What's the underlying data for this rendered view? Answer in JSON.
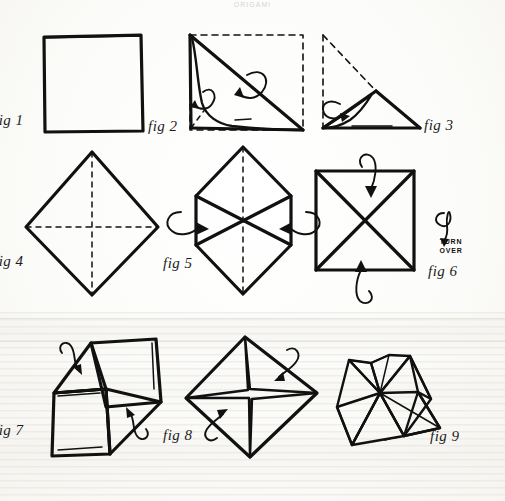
{
  "page": {
    "header_text": "ORIGAMI",
    "background_color": "#fdfdfb",
    "ink_color": "#111111",
    "width": 505,
    "height": 501
  },
  "figures": [
    {
      "id": "fig1",
      "label": "fig 1",
      "caption": "Square sheet of paper",
      "icon": "square-outline-icon"
    },
    {
      "id": "fig2",
      "label": "fig 2",
      "caption": "Fold square in half diagonally",
      "icon": "diagonal-fold-icon"
    },
    {
      "id": "fig3",
      "label": "fig 3",
      "caption": "Fold triangle in half again",
      "icon": "triangle-fold-icon"
    },
    {
      "id": "fig4",
      "label": "fig 4",
      "caption": "Unfold to square with crease diagonals",
      "icon": "diamond-creases-icon"
    },
    {
      "id": "fig 5",
      "label": "fig 5",
      "caption": "Fold side corners to centre",
      "icon": "hexagon-fold-icon"
    },
    {
      "id": "fig6",
      "label": "fig 6",
      "caption": "Smaller square with X creases, turn over",
      "icon": "square-x-icon"
    },
    {
      "id": "fig7",
      "label": "fig 7",
      "caption": "Pinwheel arrangement of flaps",
      "icon": "pinwheel-icon"
    },
    {
      "id": "fig8",
      "label": "fig 8",
      "caption": "Diamond with cross centre",
      "icon": "diamond-cross-icon"
    },
    {
      "id": "fig9",
      "label": "fig 9",
      "caption": "Finished folded form",
      "icon": "folded-form-icon"
    }
  ],
  "annotations": {
    "turn_over": "TURN\nOVER",
    "turn_over_symbol": "turn-over-loop-icon"
  }
}
